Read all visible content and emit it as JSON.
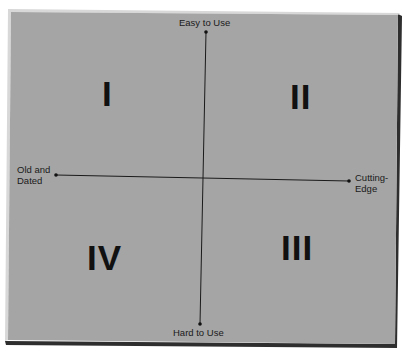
{
  "diagram": {
    "type": "quadrant-matrix",
    "colors": {
      "background": "#ffffff",
      "panel": "#a5a5a5",
      "panel_highlight": "#cfcfcf",
      "panel_shadow": "#3a3a3a",
      "ink": "#111111"
    },
    "axes": {
      "vertical": {
        "top_label": "Easy to Use",
        "bottom_label": "Hard to Use"
      },
      "horizontal": {
        "left_label_line1": "Old and",
        "left_label_line2": "Dated",
        "right_label_line1": "Cutting-",
        "right_label_line2": "Edge"
      }
    },
    "quadrants": [
      {
        "id": "top-left",
        "numeral": "I"
      },
      {
        "id": "top-right",
        "numeral": "II"
      },
      {
        "id": "bottom-right",
        "numeral": "III"
      },
      {
        "id": "bottom-left",
        "numeral": "IV"
      }
    ]
  }
}
